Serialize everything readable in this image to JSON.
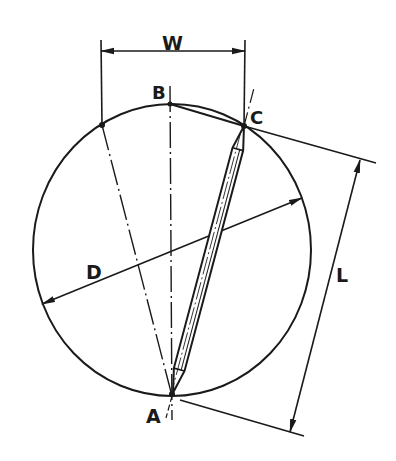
{
  "diagram": {
    "type": "geometric construction",
    "colors": {
      "ink": "#1a1a1a",
      "background": "#ffffff"
    },
    "circle": {
      "cx": 172,
      "cy": 250,
      "rx": 139,
      "ry": 146
    },
    "points": [
      {
        "id": "A",
        "label": "A",
        "x": 172,
        "y": 396,
        "label_x": 146,
        "label_y": 423
      },
      {
        "id": "B",
        "label": "B",
        "x": 170,
        "y": 104,
        "label_x": 152,
        "label_y": 99
      },
      {
        "id": "C",
        "label": "C",
        "x": 244,
        "y": 126,
        "label_x": 250,
        "label_y": 124
      }
    ],
    "dimensions": {
      "W": {
        "label": "W",
        "label_x": 162,
        "label_y": 50
      },
      "D": {
        "label": "D",
        "label_x": 86,
        "label_y": 279
      },
      "L": {
        "label": "L",
        "label_x": 336,
        "label_y": 282
      }
    },
    "rod": {
      "from": "A",
      "to": "C",
      "width": 11
    }
  }
}
